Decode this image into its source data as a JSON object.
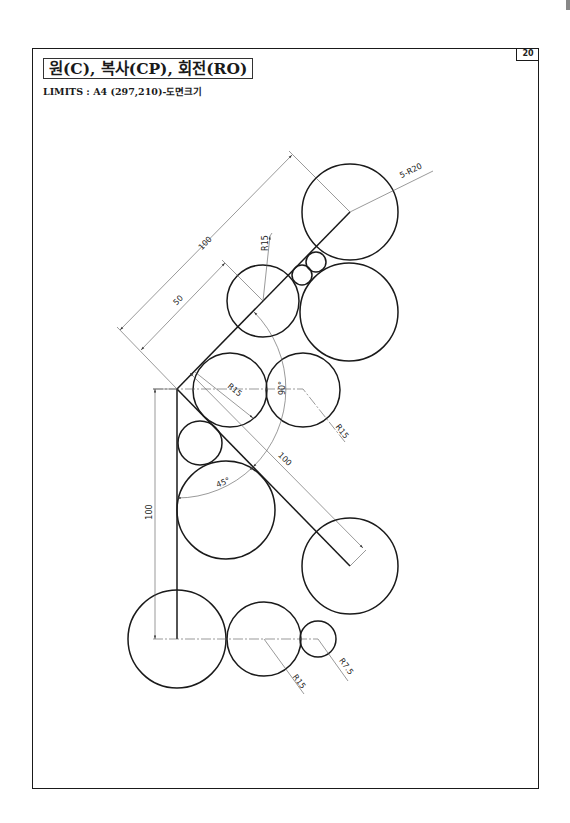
{
  "sheet": {
    "page_number": "20",
    "title": "원(C), 복사(CP), 회전(RO)",
    "limits": "LIMITS : A4 (297,210)-도면크기"
  },
  "drawing": {
    "labels": {
      "top_radius": "5-R20",
      "dim_100_upper": "100",
      "dim_50_upper": "50",
      "upper_mid_radius": "R15",
      "inner_radius_left": "R15",
      "angle_90": "90°",
      "right_radius_mid": "R15",
      "dim_100_diagonal": "100",
      "angle_45": "45°",
      "dim_100_vertical": "100",
      "bottom_radius_mid": "R15",
      "bottom_radius_small": "R7.5"
    },
    "scale_note": "R20 circles, R15 circles, R7.5 circle, small tangent circles"
  }
}
